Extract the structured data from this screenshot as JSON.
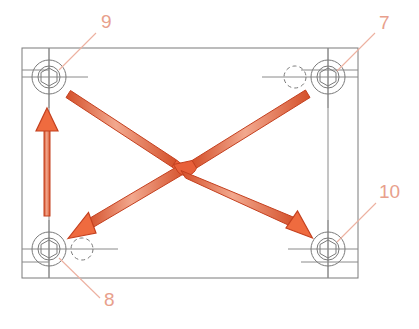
{
  "diagram": {
    "type": "technical-drawing",
    "background_color": "#ffffff"
  },
  "colors": {
    "arrow_fill": "#e8603a",
    "arrow_fill_light": "#f0a184",
    "arrow_stroke": "#c4401f",
    "outline": "#7a7a7a",
    "centerline": "#8a8a8a",
    "leader_line": "#edb0a0",
    "callout_text": "#e8a08c"
  },
  "plate": {
    "name": "mounting-plate-outline",
    "x": 22,
    "y": 48,
    "width": 336,
    "height": 230
  },
  "bolts": [
    {
      "id": "bolt-top-left",
      "callout": "9",
      "cx": 49,
      "cy": 77,
      "outer_r": 17,
      "inner_r": 11,
      "hex_r": 9,
      "has_dashed_hole": false
    },
    {
      "id": "bolt-top-right",
      "callout": "7",
      "cx": 328,
      "cy": 77,
      "outer_r": 17,
      "inner_r": 11,
      "hex_r": 9,
      "has_dashed_hole": true,
      "dashed_hole_cx": 291,
      "dashed_hole_cy": 77,
      "dashed_hole_r": 11
    },
    {
      "id": "bolt-bottom-left",
      "callout": "8",
      "cx": 49,
      "cy": 249,
      "outer_r": 17,
      "inner_r": 11,
      "hex_r": 9,
      "has_dashed_hole": true,
      "dashed_hole_cx": 85,
      "dashed_hole_cy": 249,
      "dashed_hole_r": 11
    },
    {
      "id": "bolt-bottom-right",
      "callout": "10",
      "cx": 328,
      "cy": 249,
      "outer_r": 17,
      "inner_r": 11,
      "hex_r": 9,
      "has_dashed_hole": false
    }
  ],
  "callouts": [
    {
      "label": "9",
      "name": "callout-9",
      "text_x": 101,
      "text_y": 28,
      "leader_x1": 96,
      "leader_y1": 33,
      "leader_x2": 59,
      "leader_y2": 70
    },
    {
      "label": "7",
      "name": "callout-7",
      "text_x": 379,
      "text_y": 29,
      "leader_x1": 375,
      "leader_y1": 33,
      "leader_x2": 337,
      "leader_y2": 71
    },
    {
      "label": "10",
      "name": "callout-10",
      "text_x": 379,
      "text_y": 198,
      "leader_x1": 376,
      "leader_y1": 203,
      "leader_x2": 337,
      "leader_y2": 242
    },
    {
      "label": "8",
      "name": "callout-8",
      "text_x": 104,
      "text_y": 306,
      "leader_x1": 100,
      "leader_y1": 298,
      "leader_x2": 59,
      "leader_y2": 258
    }
  ],
  "arrows": [
    {
      "name": "arrow-vertical-up",
      "from_x": 47,
      "from_y": 216,
      "to_x": 47,
      "to_y": 112,
      "direction": "up"
    },
    {
      "name": "arrow-diagonal-nw-to-sw",
      "from_x": 71,
      "from_y": 93,
      "to_x": 75,
      "to_y": 231,
      "direction": "down-left",
      "has_jog": true
    },
    {
      "name": "arrow-diagonal-ne-to-se",
      "from_x": 306,
      "from_y": 93,
      "to_x": 303,
      "to_y": 232,
      "direction": "down-right",
      "has_hop": true
    }
  ],
  "centerlines": {
    "name": "bolt-centerlines",
    "description": "horizontal and vertical construction lines through each bolt"
  }
}
